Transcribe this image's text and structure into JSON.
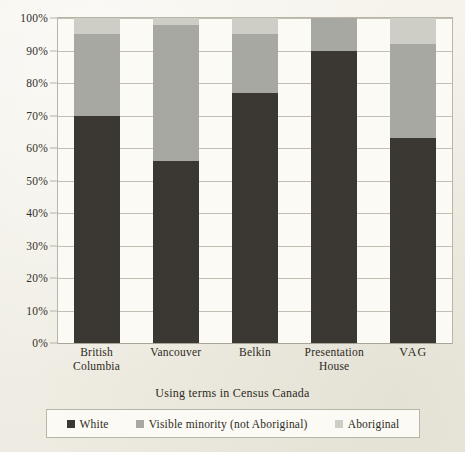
{
  "chart_data": {
    "type": "bar",
    "subtype": "stacked-percent",
    "title": "",
    "xlabel": "Using terms in Census Canada",
    "ylabel": "",
    "categories": [
      "British Columbia",
      "Vancouver",
      "Belkin",
      "Presentation House",
      "VAG"
    ],
    "series": [
      {
        "name": "White",
        "values": [
          70,
          56,
          77,
          90,
          63
        ],
        "color": "#3b3733"
      },
      {
        "name": "Visible minority (not Aboriginal)",
        "values": [
          25,
          42,
          18,
          10,
          29
        ],
        "color": "#a8a8a2"
      },
      {
        "name": "Aboriginal",
        "values": [
          5,
          2,
          5,
          0,
          8
        ],
        "color": "#cecec6"
      }
    ],
    "ylim": [
      0,
      100
    ],
    "yticks": [
      "0%",
      "10%",
      "20%",
      "30%",
      "40%",
      "50%",
      "60%",
      "70%",
      "80%",
      "90%",
      "100%"
    ],
    "ytick_values": [
      0,
      10,
      20,
      30,
      40,
      50,
      60,
      70,
      80,
      90,
      100
    ],
    "grid": true,
    "legend_position": "bottom"
  },
  "axis": {
    "x_title": "Using terms in Census Canada"
  },
  "legend": {
    "items": [
      {
        "label": "White",
        "color": "#3b3733"
      },
      {
        "label": "Visible minority (not Aboriginal)",
        "color": "#a8a8a2"
      },
      {
        "label": "Aboriginal",
        "color": "#cecec6"
      }
    ]
  }
}
